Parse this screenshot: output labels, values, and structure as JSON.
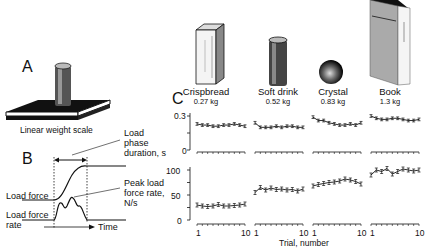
{
  "panels": {
    "a": {
      "letter": "A",
      "caption": "Linear weight scale"
    },
    "b": {
      "letter": "B",
      "load_phase_label": [
        "Load",
        "phase",
        "duration, s"
      ],
      "peak_rate_label": [
        "Peak load",
        "force rate,",
        "N/s"
      ],
      "load_force_label": "Load force",
      "load_force_rate_label": [
        "Load force",
        "rate"
      ],
      "time_label": "Time"
    },
    "c": {
      "letter": "C",
      "objects": [
        {
          "name": "Crispbread",
          "mass": "0.27  kg",
          "icon": "box-icon"
        },
        {
          "name": "Soft drink",
          "mass": "0.52  kg",
          "icon": "can-icon"
        },
        {
          "name": "Crystal",
          "mass": "0.83  kg",
          "icon": "sphere-icon"
        },
        {
          "name": "Book",
          "mass": "1.3  kg",
          "icon": "book-icon"
        }
      ],
      "top_ylabel": [
        "Load",
        "phase",
        "duration, s"
      ],
      "bottom_ylabel": [
        "Peak load",
        "force rate,",
        "N/s"
      ],
      "top_yticks": [
        "0.3",
        "0"
      ],
      "bottom_yticks": [
        "100",
        "50",
        "0"
      ],
      "xticks": [
        "1",
        "10"
      ],
      "xlabel": "Trial, number"
    }
  },
  "chart_data": [
    {
      "type": "line",
      "title": "Load phase duration per trial",
      "ylabel": "Load phase duration, s",
      "xlabel": "Trial, number",
      "ylim": [
        0,
        0.3
      ],
      "x": [
        1,
        2,
        3,
        4,
        5,
        6,
        7,
        8,
        9,
        10
      ],
      "series": [
        {
          "name": "Crispbread",
          "values": [
            0.23,
            0.22,
            0.22,
            0.21,
            0.21,
            0.22,
            0.22,
            0.23,
            0.22,
            0.21
          ]
        },
        {
          "name": "Soft drink",
          "values": [
            0.24,
            0.2,
            0.2,
            0.2,
            0.21,
            0.2,
            0.21,
            0.21,
            0.2,
            0.2
          ]
        },
        {
          "name": "Crystal",
          "values": [
            0.29,
            0.26,
            0.26,
            0.24,
            0.23,
            0.22,
            0.22,
            0.23,
            0.22,
            0.24
          ]
        },
        {
          "name": "Book",
          "values": [
            0.3,
            0.28,
            0.27,
            0.27,
            0.28,
            0.28,
            0.27,
            0.26,
            0.26,
            0.27
          ]
        }
      ]
    },
    {
      "type": "line",
      "title": "Peak load force rate per trial",
      "ylabel": "Peak load force rate, N/s",
      "xlabel": "Trial, number",
      "ylim": [
        0,
        100
      ],
      "x": [
        1,
        2,
        3,
        4,
        5,
        6,
        7,
        8,
        9,
        10
      ],
      "series": [
        {
          "name": "Crispbread",
          "values": [
            30,
            28,
            27,
            28,
            31,
            28,
            28,
            29,
            30,
            32
          ]
        },
        {
          "name": "Soft drink",
          "values": [
            55,
            65,
            60,
            64,
            61,
            62,
            60,
            61,
            58,
            62
          ]
        },
        {
          "name": "Crystal",
          "values": [
            68,
            71,
            73,
            75,
            76,
            78,
            82,
            80,
            77,
            72
          ]
        },
        {
          "name": "Book",
          "values": [
            90,
            100,
            97,
            103,
            92,
            97,
            102,
            100,
            98,
            100
          ]
        }
      ]
    }
  ]
}
